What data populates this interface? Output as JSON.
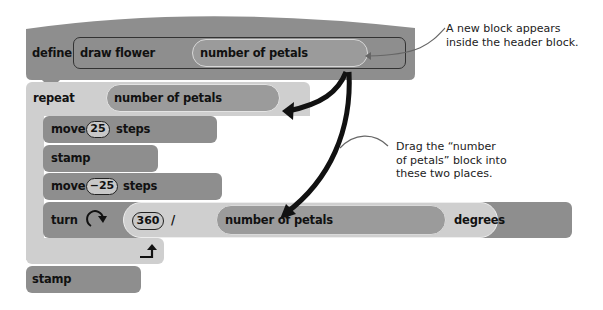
{
  "define_block": {
    "keyword": "define",
    "name": "draw flower",
    "parameter": "number of petals"
  },
  "repeat_block": {
    "keyword": "repeat",
    "argument": "number of petals"
  },
  "inner_blocks": {
    "move1": {
      "keyword": "move",
      "value": "25",
      "unit": "steps"
    },
    "stamp1": {
      "keyword": "stamp"
    },
    "move2": {
      "keyword": "move",
      "value": "−25",
      "unit": "steps"
    },
    "turn": {
      "keyword": "turn",
      "icon": "rotate-clockwise-icon",
      "dividend": "360",
      "operator": "/",
      "divisor": "number of petals",
      "unit": "degrees"
    }
  },
  "loop_end_icon": "loop-arrow-icon",
  "stamp_block": {
    "keyword": "stamp"
  },
  "annotations": {
    "top": [
      "A new block appears",
      "inside the header block."
    ],
    "middle": [
      "Drag the “number",
      "of petals” block into",
      "these two places."
    ]
  },
  "colors": {
    "dark_block": "#8e8e8e",
    "light_block": "#cfcfcf",
    "arrow": "#111111"
  }
}
